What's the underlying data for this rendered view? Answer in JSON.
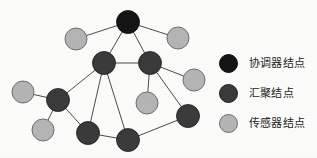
{
  "figure": {
    "background_color": "#fbfbf9"
  },
  "legend": {
    "position": "right",
    "items": [
      {
        "label": "协调器结点",
        "color": "#141414",
        "node_type": "coordinator",
        "icon": "filled-circle-icon"
      },
      {
        "label": "汇聚结点",
        "color": "#3a3a3a",
        "node_type": "aggregation",
        "icon": "filled-circle-icon"
      },
      {
        "label": "传感器结点",
        "color": "#b4b4b4",
        "node_type": "sensor",
        "icon": "filled-circle-icon"
      }
    ]
  },
  "chart_data": {
    "type": "scatter",
    "title": "",
    "xlabel": "",
    "ylabel": "",
    "layout": "node-link network topology",
    "node_styles": {
      "coordinator": {
        "fill": "#141414",
        "stroke": "#0a0a0a",
        "radius": 11.5
      },
      "aggregation": {
        "fill": "#3a3a3a",
        "stroke": "#1c1c1c",
        "radius": 11.5
      },
      "sensor": {
        "fill": "#b4b4b4",
        "stroke": "#6e6e6e",
        "radius": 11
      }
    },
    "edge_style": {
      "stroke": "#4a4a4a",
      "width": 1
    },
    "nodes": [
      {
        "id": "C1",
        "type": "coordinator",
        "x": 128,
        "y": 22
      },
      {
        "id": "S1",
        "type": "sensor",
        "x": 76,
        "y": 39
      },
      {
        "id": "S2",
        "type": "sensor",
        "x": 178,
        "y": 38
      },
      {
        "id": "A1",
        "type": "aggregation",
        "x": 104,
        "y": 63
      },
      {
        "id": "A2",
        "type": "aggregation",
        "x": 150,
        "y": 63
      },
      {
        "id": "S3",
        "type": "sensor",
        "x": 194,
        "y": 80
      },
      {
        "id": "S4",
        "type": "sensor",
        "x": 147,
        "y": 103
      },
      {
        "id": "S5",
        "type": "sensor",
        "x": 23,
        "y": 92
      },
      {
        "id": "A3",
        "type": "aggregation",
        "x": 58,
        "y": 100
      },
      {
        "id": "S6",
        "type": "sensor",
        "x": 43,
        "y": 130
      },
      {
        "id": "A4",
        "type": "aggregation",
        "x": 88,
        "y": 133
      },
      {
        "id": "A5",
        "type": "aggregation",
        "x": 128,
        "y": 140
      },
      {
        "id": "A6",
        "type": "aggregation",
        "x": 188,
        "y": 116
      }
    ],
    "edges": [
      {
        "source": "C1",
        "target": "S1"
      },
      {
        "source": "C1",
        "target": "S2"
      },
      {
        "source": "C1",
        "target": "A1"
      },
      {
        "source": "C1",
        "target": "A2"
      },
      {
        "source": "A1",
        "target": "A2"
      },
      {
        "source": "A1",
        "target": "A3"
      },
      {
        "source": "A1",
        "target": "A4"
      },
      {
        "source": "A1",
        "target": "A5"
      },
      {
        "source": "A2",
        "target": "S3"
      },
      {
        "source": "A2",
        "target": "S4"
      },
      {
        "source": "A2",
        "target": "A6"
      },
      {
        "source": "A3",
        "target": "S5"
      },
      {
        "source": "A3",
        "target": "S6"
      },
      {
        "source": "A3",
        "target": "A4"
      },
      {
        "source": "A4",
        "target": "A5"
      },
      {
        "source": "A5",
        "target": "A6"
      }
    ]
  }
}
